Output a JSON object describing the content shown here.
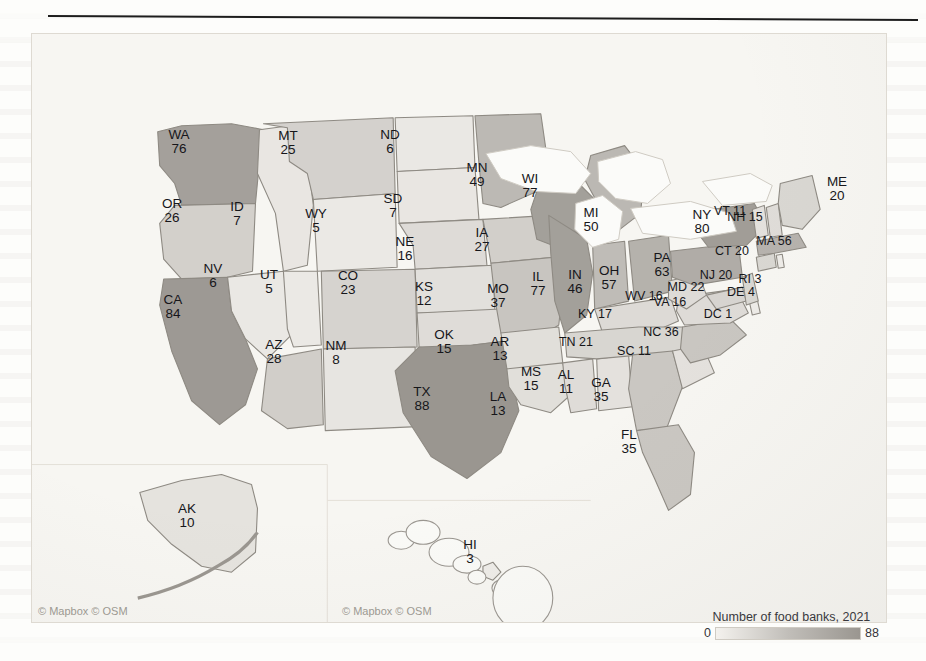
{
  "page": {
    "background_color": "#fdfdfb",
    "divider_color": "#1d1d1d"
  },
  "map": {
    "frame_color": "#f7f6f2",
    "border_color": "#8e8a83",
    "attribution_main": "© Mapbox © OSM",
    "attribution_inset": "© Mapbox © OSM"
  },
  "legend": {
    "title": "Number of food banks, 2021",
    "min_label": "0",
    "max_label": "88",
    "min_color": "#f4f2ee",
    "max_color": "#9a9690"
  },
  "chart_data": {
    "type": "choropleth",
    "title": "Number of food banks, 2021",
    "value_field": "food_banks",
    "unit": "food banks",
    "year": 2021,
    "color_scale": {
      "type": "sequential-gray",
      "domain": [
        0,
        88
      ],
      "low_color": "#f4f2ee",
      "high_color": "#9a9690"
    },
    "regions": [
      {
        "code": "WA",
        "value": 76,
        "x": 178,
        "y": 141
      },
      {
        "code": "OR",
        "value": 26,
        "x": 171,
        "y": 210
      },
      {
        "code": "CA",
        "value": 84,
        "x": 172,
        "y": 306
      },
      {
        "code": "NV",
        "value": 6,
        "x": 212,
        "y": 275
      },
      {
        "code": "ID",
        "value": 7,
        "x": 236,
        "y": 213
      },
      {
        "code": "MT",
        "value": 25,
        "x": 287,
        "y": 142
      },
      {
        "code": "WY",
        "value": 5,
        "x": 315,
        "y": 220
      },
      {
        "code": "UT",
        "value": 5,
        "x": 268,
        "y": 281
      },
      {
        "code": "AZ",
        "value": 28,
        "x": 273,
        "y": 351
      },
      {
        "code": "CO",
        "value": 23,
        "x": 347,
        "y": 282
      },
      {
        "code": "NM",
        "value": 8,
        "x": 335,
        "y": 352
      },
      {
        "code": "ND",
        "value": 6,
        "x": 389,
        "y": 141
      },
      {
        "code": "SD",
        "value": 7,
        "x": 392,
        "y": 205
      },
      {
        "code": "NE",
        "value": 16,
        "x": 404,
        "y": 248
      },
      {
        "code": "KS",
        "value": 12,
        "x": 423,
        "y": 293
      },
      {
        "code": "OK",
        "value": 15,
        "x": 443,
        "y": 341
      },
      {
        "code": "TX",
        "value": 88,
        "x": 421,
        "y": 398
      },
      {
        "code": "MN",
        "value": 49,
        "x": 476,
        "y": 174
      },
      {
        "code": "IA",
        "value": 27,
        "x": 481,
        "y": 239
      },
      {
        "code": "MO",
        "value": 37,
        "x": 497,
        "y": 295
      },
      {
        "code": "AR",
        "value": 13,
        "x": 499,
        "y": 348
      },
      {
        "code": "LA",
        "value": 13,
        "x": 497,
        "y": 403
      },
      {
        "code": "MS",
        "value": 15,
        "x": 530,
        "y": 378
      },
      {
        "code": "AL",
        "value": 11,
        "x": 565,
        "y": 381
      },
      {
        "code": "WI",
        "value": 77,
        "x": 529,
        "y": 185
      },
      {
        "code": "IL",
        "value": 77,
        "x": 537,
        "y": 283
      },
      {
        "code": "IN",
        "value": 46,
        "x": 574,
        "y": 281
      },
      {
        "code": "MI",
        "value": 50,
        "x": 590,
        "y": 219
      },
      {
        "code": "OH",
        "value": 57,
        "x": 608,
        "y": 277
      },
      {
        "code": "KY",
        "value": 17,
        "x": 594,
        "y": 312
      },
      {
        "code": "TN",
        "value": 21,
        "x": 575,
        "y": 340
      },
      {
        "code": "GA",
        "value": 35,
        "x": 600,
        "y": 389
      },
      {
        "code": "FL",
        "value": 35,
        "x": 628,
        "y": 441
      },
      {
        "code": "SC",
        "value": 11,
        "x": 633,
        "y": 349
      },
      {
        "code": "NC",
        "value": 36,
        "x": 660,
        "y": 330
      },
      {
        "code": "VA",
        "value": 16,
        "x": 669,
        "y": 300
      },
      {
        "code": "WV",
        "value": 16,
        "x": 643,
        "y": 294
      },
      {
        "code": "PA",
        "value": 63,
        "x": 661,
        "y": 264
      },
      {
        "code": "NY",
        "value": 80,
        "x": 701,
        "y": 221
      },
      {
        "code": "MD",
        "value": 22,
        "x": 685,
        "y": 285
      },
      {
        "code": "DC",
        "value": 1,
        "x": 717,
        "y": 312
      },
      {
        "code": "DE",
        "value": 4,
        "x": 740,
        "y": 290
      },
      {
        "code": "NJ",
        "value": 20,
        "x": 715,
        "y": 273
      },
      {
        "code": "RI",
        "value": 3,
        "x": 749,
        "y": 277
      },
      {
        "code": "CT",
        "value": 20,
        "x": 731,
        "y": 249
      },
      {
        "code": "MA",
        "value": 56,
        "x": 773,
        "y": 239
      },
      {
        "code": "NH",
        "value": 15,
        "x": 744,
        "y": 215
      },
      {
        "code": "VT",
        "value": 11,
        "x": 729,
        "y": 209
      },
      {
        "code": "ME",
        "value": 20,
        "x": 836,
        "y": 188
      },
      {
        "code": "AK",
        "value": 10,
        "x": 186,
        "y": 515
      },
      {
        "code": "HI",
        "value": 3,
        "x": 469,
        "y": 551
      }
    ]
  }
}
